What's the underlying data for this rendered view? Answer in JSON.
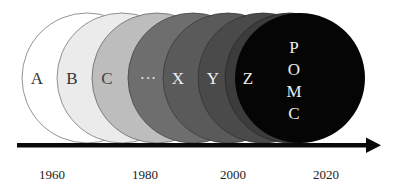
{
  "diagram": {
    "type": "overlapping-circles-timeline",
    "circles": [
      {
        "label": "A",
        "fill": "#ffffff",
        "text_color": "#333333"
      },
      {
        "label": "B",
        "fill": "#ebebeb",
        "text_color": "#333333"
      },
      {
        "label": "C",
        "fill": "#bdbdbd",
        "text_color": "#444444"
      },
      {
        "label": "···",
        "fill": "#6e6e6e",
        "text_color": "#e0e0e0"
      },
      {
        "label": "X",
        "fill": "#5a5a5a",
        "text_color": "#eeeeee"
      },
      {
        "label": "Y",
        "fill": "#4a4a4a",
        "text_color": "#eeeeee"
      },
      {
        "label": "Z",
        "fill": "#3c3c3c",
        "text_color": "#eeeeee"
      },
      {
        "label": "POMC",
        "letters": [
          "P",
          "O",
          "M",
          "C"
        ],
        "fill": "#050505",
        "text_color": "#eeeeee"
      }
    ],
    "axis": {
      "direction": "right",
      "ticks": [
        "1960",
        "1980",
        "2000",
        "2020"
      ]
    }
  }
}
